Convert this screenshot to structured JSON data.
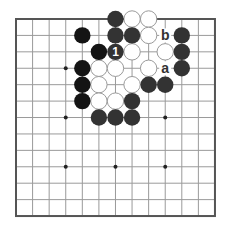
{
  "board": {
    "size": 13,
    "origin": {
      "x": 16,
      "y": 19
    },
    "spacing": {
      "x": 16.58,
      "y": 16.42
    },
    "stone_radius": 8.2,
    "colors": {
      "background": "#ffffff",
      "grid": "#9a9a9a",
      "border": "#555555",
      "star": "#222222",
      "black_stone": "#333333",
      "black_stone_dark": "#141414",
      "white_stone_fill": "#ffffff",
      "white_stone_stroke": "#9a9a9a",
      "label": "#333333",
      "move_number": "#ffffff"
    },
    "star_points": [
      [
        3,
        3
      ],
      [
        3,
        6
      ],
      [
        3,
        9
      ],
      [
        6,
        6
      ],
      [
        6,
        9
      ],
      [
        9,
        3
      ],
      [
        9,
        6
      ],
      [
        9,
        9
      ],
      [
        6,
        3
      ]
    ],
    "visible_star_points": [
      [
        3,
        3
      ],
      [
        3,
        6
      ],
      [
        9,
        6
      ],
      [
        3,
        9
      ],
      [
        6,
        9
      ],
      [
        9,
        9
      ]
    ]
  },
  "stones": {
    "black": [
      {
        "col": 6,
        "row": 0
      },
      {
        "col": 6,
        "row": 1
      },
      {
        "col": 7,
        "row": 1
      },
      {
        "col": 10,
        "row": 1
      },
      {
        "col": 10,
        "row": 2
      },
      {
        "col": 10,
        "row": 3
      },
      {
        "col": 8,
        "row": 4
      },
      {
        "col": 9,
        "row": 4
      },
      {
        "col": 7,
        "row": 5
      },
      {
        "col": 5,
        "row": 6
      },
      {
        "col": 6,
        "row": 6
      },
      {
        "col": 7,
        "row": 6
      }
    ],
    "black_dark": [
      {
        "col": 4,
        "row": 1
      },
      {
        "col": 5,
        "row": 2
      },
      {
        "col": 4,
        "row": 3
      },
      {
        "col": 4,
        "row": 4
      },
      {
        "col": 4,
        "row": 5
      }
    ],
    "white": [
      {
        "col": 7,
        "row": 0
      },
      {
        "col": 8,
        "row": 0
      },
      {
        "col": 8,
        "row": 1
      },
      {
        "col": 7,
        "row": 2
      },
      {
        "col": 9,
        "row": 2
      },
      {
        "col": 5,
        "row": 3
      },
      {
        "col": 6,
        "row": 3
      },
      {
        "col": 8,
        "row": 3
      },
      {
        "col": 5,
        "row": 4
      },
      {
        "col": 7,
        "row": 4
      },
      {
        "col": 5,
        "row": 5
      },
      {
        "col": 6,
        "row": 5
      }
    ]
  },
  "moves": [
    {
      "number": "1",
      "color": "black",
      "col": 6,
      "row": 2
    }
  ],
  "labels": [
    {
      "text": "b",
      "col": 9,
      "row": 1
    },
    {
      "text": "a",
      "col": 9,
      "row": 3
    }
  ]
}
